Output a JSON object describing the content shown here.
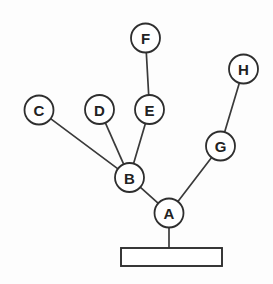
{
  "diagram": {
    "canvas": {
      "width": 273,
      "height": 284,
      "background": "#fdfdfd"
    },
    "style": {
      "node_fill": "#ffffff",
      "node_stroke": "#2e2e2e",
      "edge_stroke": "#3a3a3a",
      "label_color": "#222222",
      "node_radius": 14.5
    },
    "nodes": [
      {
        "id": "A",
        "label": "A",
        "x": 169.0,
        "y": 213.0,
        "r": 14.5
      },
      {
        "id": "B",
        "label": "B",
        "x": 129.5,
        "y": 177.5,
        "r": 14.5
      },
      {
        "id": "C",
        "label": "C",
        "x": 39.0,
        "y": 110.0,
        "r": 14.5
      },
      {
        "id": "D",
        "label": "D",
        "x": 99.5,
        "y": 109.5,
        "r": 14.5
      },
      {
        "id": "E",
        "label": "E",
        "x": 149.5,
        "y": 109.5,
        "r": 14.5
      },
      {
        "id": "F",
        "label": "F",
        "x": 145.5,
        "y": 38.0,
        "r": 14.5
      },
      {
        "id": "G",
        "label": "G",
        "x": 220.5,
        "y": 146.0,
        "r": 14.5
      },
      {
        "id": "H",
        "label": "H",
        "x": 243.5,
        "y": 69.0,
        "r": 14.5
      }
    ],
    "edges": [
      {
        "from": "F",
        "to": "E"
      },
      {
        "from": "E",
        "to": "B"
      },
      {
        "from": "D",
        "to": "B"
      },
      {
        "from": "C",
        "to": "B"
      },
      {
        "from": "B",
        "to": "A"
      },
      {
        "from": "A",
        "to": "G"
      },
      {
        "from": "G",
        "to": "H"
      }
    ],
    "base": {
      "label": "",
      "x": 121.0,
      "y": 248.0,
      "width": 101.0,
      "height": 18.0,
      "stem_from_node": "A",
      "stem_x": 169.0,
      "stem_top_y": 227.5,
      "stem_bottom_y": 248.0
    }
  }
}
